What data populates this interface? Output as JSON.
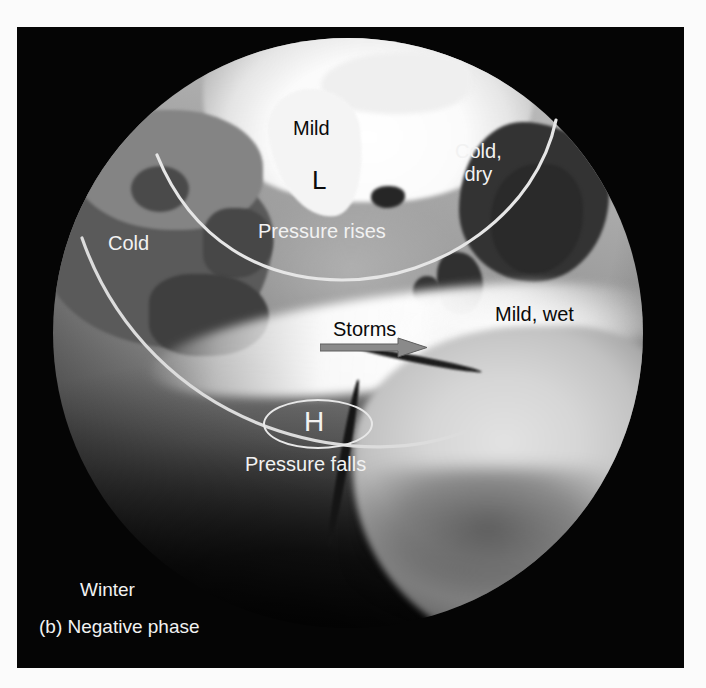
{
  "figure": {
    "caption": "(b) Negative phase",
    "season": "Winter",
    "panel_background": "#050505",
    "annotation_white": "#f2f2f2",
    "annotation_black": "#0a0a0a"
  },
  "labels": {
    "mild": "Mild",
    "cold_dry_line1": "Cold,",
    "cold_dry_line2": "dry",
    "low_pressure_symbol": "L",
    "cold": "Cold",
    "pressure_rises": "Pressure rises",
    "storms": "Storms",
    "mild_wet": "Mild, wet",
    "high_pressure_symbol": "H",
    "pressure_falls": "Pressure falls"
  },
  "icons": {
    "storm_arrow": "arrow-right-icon",
    "high_pressure_oval": "oval-outline-icon",
    "jet_stream_arc_upper": "arc-icon",
    "jet_stream_arc_lower": "arc-icon",
    "globe": "globe-icon"
  }
}
